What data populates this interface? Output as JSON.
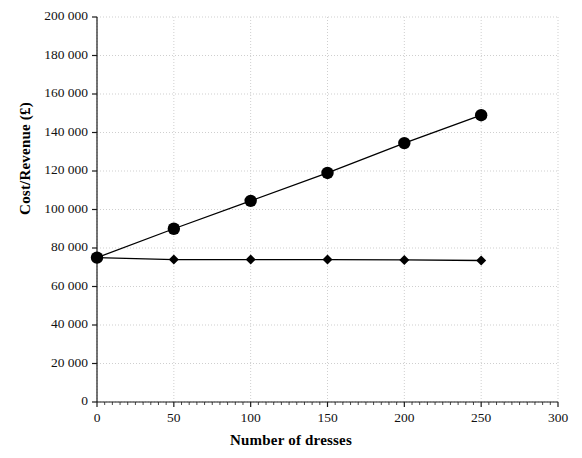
{
  "chart_data": {
    "type": "line",
    "title": "",
    "xlabel": "Number of dresses",
    "ylabel": "Cost/Revenue (£)",
    "xlim": [
      0,
      300
    ],
    "ylim": [
      0,
      200000
    ],
    "x_ticks": [
      "0",
      "50",
      "100",
      "150",
      "200",
      "250",
      "300"
    ],
    "x_tick_values": [
      0,
      50,
      100,
      150,
      200,
      250,
      300
    ],
    "y_ticks": [
      "0",
      "20 000",
      "40 000",
      "60 000",
      "80 000",
      "100 000",
      "120 000",
      "140 000",
      "160 000",
      "180 000",
      "200 000"
    ],
    "y_tick_values": [
      0,
      20000,
      40000,
      60000,
      80000,
      100000,
      120000,
      140000,
      160000,
      180000,
      200000
    ],
    "grid": true,
    "grid_style": "dotted",
    "legend": "none",
    "x": [
      0,
      50,
      100,
      150,
      200,
      250
    ],
    "series": [
      {
        "name": "Revenue",
        "marker": "circle",
        "color": "#000000",
        "values": [
          75000,
          90000,
          104500,
          119000,
          134500,
          149000
        ]
      },
      {
        "name": "Cost",
        "marker": "diamond",
        "color": "#000000",
        "values": [
          75000,
          74000,
          74000,
          74000,
          73800,
          73500
        ]
      }
    ]
  },
  "colors": {
    "axis": "#1a1a1a",
    "grid": "#cfcfcf",
    "marker": "#000000",
    "background": "#ffffff"
  }
}
